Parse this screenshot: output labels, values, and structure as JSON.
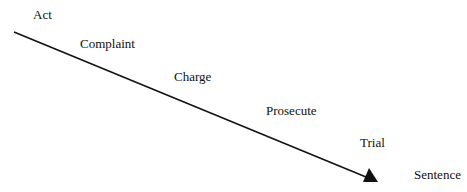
{
  "diagram": {
    "type": "descending-arrow-sequence",
    "stages": [
      {
        "id": "act",
        "label": "Act"
      },
      {
        "id": "complaint",
        "label": "Complaint"
      },
      {
        "id": "charge",
        "label": "Charge"
      },
      {
        "id": "prosecute",
        "label": "Prosecute"
      },
      {
        "id": "trial",
        "label": "Trial"
      },
      {
        "id": "sentence",
        "label": "Sentence"
      }
    ],
    "arrow": {
      "from": [
        14,
        32
      ],
      "to": [
        378,
        182
      ],
      "color": "#111111"
    }
  }
}
